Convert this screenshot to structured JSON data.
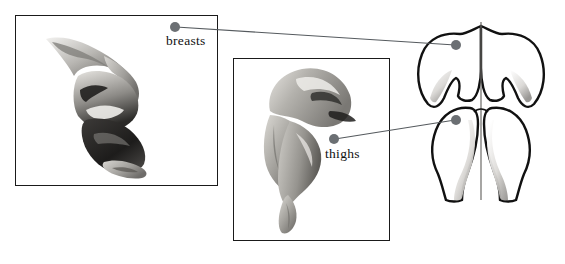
{
  "figure": {
    "background_color": "#ffffff",
    "line_color": "#1a1a1a",
    "leader_color": "#555a5e",
    "dot_color": "#6b6f73"
  },
  "labels": {
    "breasts": "breasts",
    "thighs": "thighs"
  },
  "panels": [
    {
      "name": "breast-specimen-panel",
      "caption": "breasts",
      "x": 15,
      "y": 15,
      "width": 203,
      "height": 171
    },
    {
      "name": "thigh-specimen-panel",
      "caption": "thighs",
      "x": 233,
      "y": 58,
      "width": 157,
      "height": 183
    }
  ],
  "leaders": [
    {
      "name": "breasts-leader",
      "label": "breasts",
      "from_x": 175,
      "from_y": 27,
      "to_x": 456,
      "to_y": 45
    },
    {
      "name": "thighs-leader",
      "label": "thighs",
      "from_x": 334,
      "from_y": 139,
      "to_x": 456,
      "to_y": 120
    }
  ],
  "schematic": {
    "name": "carcass-outline",
    "x": 400,
    "y": 10,
    "width": 160,
    "height": 200,
    "parts": [
      "left-breast-lobe",
      "right-breast-lobe",
      "left-thigh",
      "right-thigh",
      "center-line"
    ]
  },
  "dots": [
    {
      "name": "breasts-label-dot",
      "x": 175,
      "y": 27,
      "r": 5.0
    },
    {
      "name": "breasts-target-dot",
      "x": 456,
      "y": 45,
      "r": 5.0
    },
    {
      "name": "thighs-label-dot",
      "x": 334,
      "y": 139,
      "r": 5.0
    },
    {
      "name": "thighs-target-dot",
      "x": 456,
      "y": 120,
      "r": 5.0
    }
  ]
}
